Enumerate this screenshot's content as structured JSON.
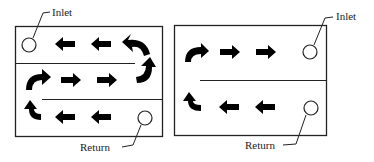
{
  "diagrams": [
    {
      "name": "three-pass-flow",
      "inlet_label": "Inlet",
      "return_label": "Return",
      "passes": [
        "left",
        "right",
        "left"
      ]
    },
    {
      "name": "two-pass-flow",
      "inlet_label": "Inlet",
      "return_label": "Return",
      "passes": [
        "right",
        "left"
      ]
    }
  ],
  "colors": {
    "line": "#222222",
    "arrow": "#000000",
    "background": "#ffffff"
  }
}
